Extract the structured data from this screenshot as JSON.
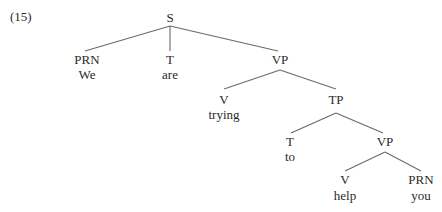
{
  "example_number": "(15)",
  "tree": {
    "nodes": [
      {
        "id": "S",
        "label": "S",
        "word": "",
        "x": 170,
        "y": 22
      },
      {
        "id": "PRN1",
        "label": "PRN",
        "word": "We",
        "x": 87,
        "y": 64
      },
      {
        "id": "T1",
        "label": "T",
        "word": "are",
        "x": 170,
        "y": 64
      },
      {
        "id": "VP1",
        "label": "VP",
        "word": "",
        "x": 280,
        "y": 64
      },
      {
        "id": "V1",
        "label": "V",
        "word": "trying",
        "x": 224,
        "y": 104
      },
      {
        "id": "TP",
        "label": "TP",
        "word": "",
        "x": 336,
        "y": 104
      },
      {
        "id": "T2",
        "label": "T",
        "word": "to",
        "x": 290,
        "y": 146
      },
      {
        "id": "VP2",
        "label": "VP",
        "word": "",
        "x": 385,
        "y": 146
      },
      {
        "id": "V2",
        "label": "V",
        "word": "help",
        "x": 345,
        "y": 184
      },
      {
        "id": "PRN2",
        "label": "PRN",
        "word": "you",
        "x": 421,
        "y": 184
      }
    ],
    "edges": [
      {
        "from": "S",
        "to": "PRN1",
        "x1": 170,
        "y1": 26,
        "x2": 85,
        "y2": 51
      },
      {
        "from": "S",
        "to": "T1",
        "x1": 170,
        "y1": 26,
        "x2": 170,
        "y2": 51
      },
      {
        "from": "S",
        "to": "VP1",
        "x1": 170,
        "y1": 26,
        "x2": 278,
        "y2": 51
      },
      {
        "from": "VP1",
        "to": "V1",
        "x1": 280,
        "y1": 70,
        "x2": 224,
        "y2": 89
      },
      {
        "from": "VP1",
        "to": "TP",
        "x1": 280,
        "y1": 70,
        "x2": 336,
        "y2": 89
      },
      {
        "from": "TP",
        "to": "T2",
        "x1": 336,
        "y1": 113,
        "x2": 291,
        "y2": 133
      },
      {
        "from": "TP",
        "to": "VP2",
        "x1": 336,
        "y1": 113,
        "x2": 383,
        "y2": 133
      },
      {
        "from": "VP2",
        "to": "V2",
        "x1": 385,
        "y1": 152,
        "x2": 345,
        "y2": 171
      },
      {
        "from": "VP2",
        "to": "PRN2",
        "x1": 385,
        "y1": 152,
        "x2": 421,
        "y2": 171
      }
    ]
  }
}
